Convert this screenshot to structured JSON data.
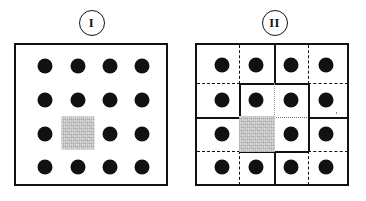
{
  "figure": {
    "background_color": "#ffffff",
    "dot_color": "#111111",
    "line_color": "#111111",
    "defect_color": "#dcdcdc"
  },
  "panels": [
    {
      "id": "panel-1",
      "label": "I",
      "caption_shape": "circle",
      "frame": {
        "style": "solid",
        "border_px": 2.6
      },
      "grid": {
        "rows": 4,
        "cols": 4,
        "internal_lines": "none"
      },
      "dots": {
        "count": 15,
        "shape": "filled-circle",
        "missing_positions": [
          {
            "row": 3,
            "col": 2
          }
        ]
      },
      "defect": {
        "type": "gray-square",
        "row": 3,
        "col": 2,
        "color": "#dcdcdc"
      }
    },
    {
      "id": "panel-2",
      "label": "II",
      "caption_shape": "circle",
      "frame": {
        "style": "solid",
        "border_px": 2.6
      },
      "grid": {
        "rows": 4,
        "cols": 4,
        "internal_lines": "mixed",
        "line_styles": {
          "solid": "cell boundaries of outer supercells",
          "dashed": "original lattice cell boundaries outside the relaxed region",
          "dotted": "sub-divisions inside the bold central block"
        }
      },
      "bold_block": {
        "description": "Heavy solid square enclosing the 2x2 central region",
        "rows": [
          2,
          3
        ],
        "cols": [
          2,
          3
        ]
      },
      "dots": {
        "count": 15,
        "shape": "filled-circle",
        "missing_positions": [
          {
            "row": 3,
            "col": 2
          }
        ]
      },
      "defect": {
        "type": "gray-square",
        "row": 3,
        "col": 2,
        "color": "#dcdcdc"
      }
    }
  ]
}
